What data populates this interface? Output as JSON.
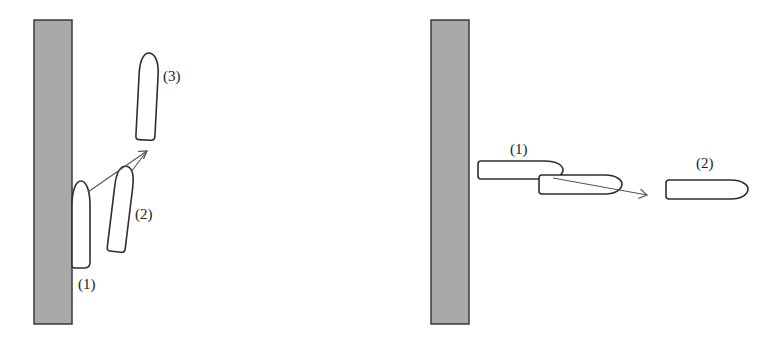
{
  "figure": {
    "colors": {
      "wall_fill": "#a9a9a9",
      "wall_stroke": "#3a3a3a",
      "hull_stroke": "#2e2e2e",
      "arrow": "#555555",
      "background": "#ffffff"
    },
    "left_panel": {
      "description": "Ship berthed alongside wall, departing bow-first at an angle",
      "labels": {
        "pos1": "(1)",
        "pos2": "(2)",
        "pos3": "(3)"
      }
    },
    "right_panel": {
      "description": "Ship moored perpendicular to wall, moving away",
      "labels": {
        "pos1": "(1)",
        "pos2": "(2)"
      }
    }
  }
}
